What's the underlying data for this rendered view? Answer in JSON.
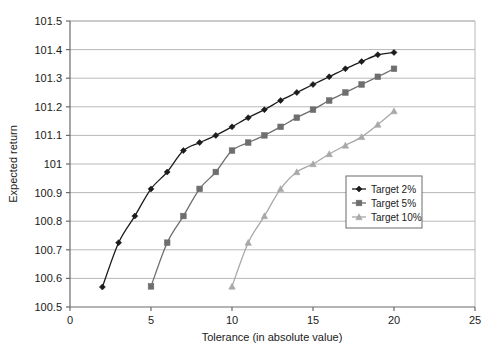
{
  "chart_data": {
    "type": "line",
    "title": "",
    "xlabel": "Tolerance (in absolute value)",
    "ylabel": "Expected return",
    "xlim": [
      0,
      25
    ],
    "ylim": [
      100.5,
      101.5
    ],
    "xticks": [
      0,
      5,
      10,
      15,
      20,
      25
    ],
    "xtick_labels": [
      "0",
      "5",
      "10",
      "15",
      "20",
      "25"
    ],
    "yticks": [
      100.5,
      100.6,
      100.7,
      100.8,
      100.9,
      101,
      101.1,
      101.2,
      101.3,
      101.4,
      101.5
    ],
    "ytick_labels": [
      "100.5",
      "100.6",
      "100.7",
      "100.8",
      "100.9",
      "101",
      "101.1",
      "101.2",
      "101.3",
      "101.4",
      "101.5"
    ],
    "grid": "horizontal",
    "legend_position": "center-right",
    "series": [
      {
        "name": "Target 2%",
        "color": "#1c1c1c",
        "marker": "diamond",
        "x": [
          2,
          3,
          4,
          5,
          6,
          7,
          8,
          9,
          10,
          11,
          12,
          13,
          14,
          15,
          16,
          17,
          18,
          19,
          20
        ],
        "y": [
          100.57,
          100.725,
          100.818,
          100.913,
          100.972,
          101.047,
          101.075,
          101.1,
          101.13,
          101.162,
          101.19,
          101.222,
          101.25,
          101.278,
          101.305,
          101.333,
          101.358,
          101.382,
          101.39
        ]
      },
      {
        "name": "Target 5%",
        "color": "#6e6e6e",
        "marker": "square",
        "x": [
          5,
          6,
          7,
          8,
          9,
          10,
          11,
          12,
          13,
          14,
          15,
          16,
          17,
          18,
          19,
          20
        ],
        "y": [
          100.572,
          100.725,
          100.818,
          100.913,
          100.972,
          101.047,
          101.075,
          101.1,
          101.13,
          101.162,
          101.19,
          101.222,
          101.25,
          101.278,
          101.305,
          101.333
        ]
      },
      {
        "name": "Target 10%",
        "color": "#a8a8a8",
        "marker": "triangle",
        "x": [
          10,
          11,
          12,
          13,
          14,
          15,
          16,
          17,
          18,
          19,
          20
        ],
        "y": [
          100.572,
          100.725,
          100.818,
          100.913,
          100.972,
          101.0,
          101.035,
          101.065,
          101.095,
          101.138,
          101.185
        ]
      }
    ]
  },
  "legend": {
    "items": [
      {
        "label": "Target 2%"
      },
      {
        "label": "Target 5%"
      },
      {
        "label": "Target 10%"
      }
    ]
  },
  "axes": {
    "x_title": "Tolerance (in absolute value)",
    "y_title": "Expected return"
  }
}
